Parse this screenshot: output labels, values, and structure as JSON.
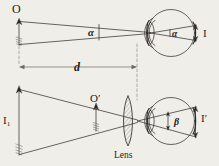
{
  "figure": {
    "type": "optics-ray-diagram",
    "title_visible": false,
    "paper_color": "#efeee9",
    "ink_color": "#2a2724",
    "labels": {
      "object_top": "O",
      "image_top": "I",
      "angle_top_left": "α",
      "angle_top_eye": "α",
      "distance": "d",
      "object_bottom": "I₁",
      "virtual_object_bottom": "O′",
      "image_bottom": "I′",
      "angle_bottom_eye": "β",
      "lens": "Lens"
    },
    "elements": [
      {
        "name": "top-object-arrow",
        "label": "O",
        "kind": "upright-arrow"
      },
      {
        "name": "top-ray-bundle",
        "kind": "converging-rays"
      },
      {
        "name": "top-angle-alpha",
        "label": "α",
        "kind": "angle-marker"
      },
      {
        "name": "top-eye",
        "kind": "eyeball"
      },
      {
        "name": "top-retinal-image",
        "label": "I",
        "kind": "down-arrow"
      },
      {
        "name": "distance-dimension",
        "label": "d",
        "kind": "double-arrow"
      },
      {
        "name": "bottom-object-arrow",
        "label": "I₁",
        "kind": "upright-arrow"
      },
      {
        "name": "bottom-virtual-image-arrow",
        "label": "O′",
        "kind": "upright-arrow"
      },
      {
        "name": "converging-lens",
        "label": "Lens",
        "kind": "biconvex-hatched"
      },
      {
        "name": "bottom-eye",
        "kind": "eyeball"
      },
      {
        "name": "bottom-angle-beta",
        "label": "β",
        "kind": "angle-marker"
      },
      {
        "name": "bottom-retinal-image",
        "label": "I′",
        "kind": "down-arrow"
      }
    ]
  }
}
